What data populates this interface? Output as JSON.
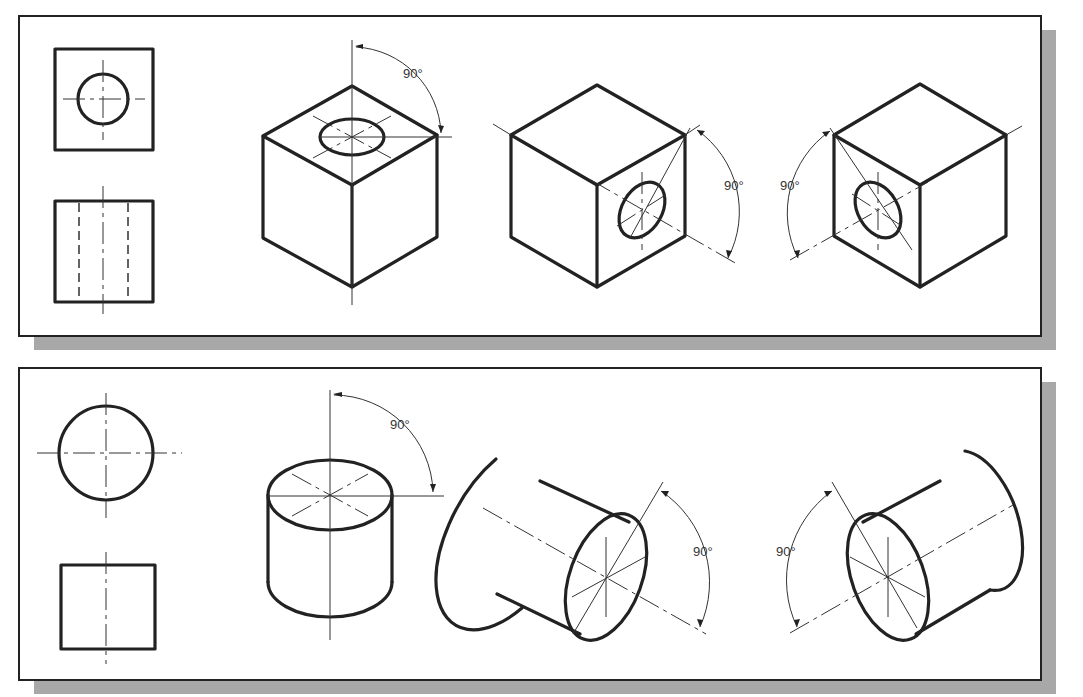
{
  "figure": {
    "panels": [
      {
        "name": "cube-panel",
        "orthographic_views": [
          "top-view-square-with-hole",
          "front-view-square-with-hidden-lines"
        ],
        "isometric_views": [
          {
            "name": "cube-hole-top",
            "angle_label": "90°"
          },
          {
            "name": "cube-hole-right",
            "angle_label": "90°"
          },
          {
            "name": "cube-hole-left",
            "angle_label": "90°"
          }
        ]
      },
      {
        "name": "cylinder-panel",
        "orthographic_views": [
          "top-view-circle",
          "front-view-square"
        ],
        "isometric_views": [
          {
            "name": "cylinder-vertical",
            "angle_label": "90°"
          },
          {
            "name": "cylinder-right",
            "angle_label": "90°"
          },
          {
            "name": "cylinder-left",
            "angle_label": "90°"
          }
        ]
      }
    ],
    "colors": {
      "line": "#222222",
      "shadow": "#a8a8a8",
      "background": "#ffffff"
    }
  },
  "labels": {
    "cube1_angle": "90°",
    "cube2_angle": "90°",
    "cube3_angle": "90°",
    "cyl1_angle": "90°",
    "cyl2_angle": "90°",
    "cyl3_angle": "90°"
  }
}
